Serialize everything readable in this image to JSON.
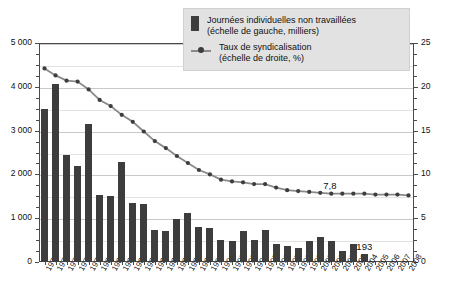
{
  "chart_data": {
    "type": "bar",
    "title": "",
    "subtitle": "",
    "xlabel": "",
    "ylabel": "",
    "grid": true,
    "legend_position": "top-right",
    "categories": [
      "1975",
      "1976",
      "1977",
      "1978",
      "1979",
      "1980",
      "1981",
      "1982",
      "1983",
      "1984",
      "1985",
      "1986",
      "1987",
      "1988",
      "1989",
      "1990",
      "1991",
      "1992",
      "1993",
      "1994",
      "1995",
      "1996",
      "1997",
      "1998",
      "1999",
      "2000",
      "2001",
      "2002",
      "2003",
      "2004",
      "2005",
      "2006",
      "2007",
      "2008"
    ],
    "axes": {
      "left": {
        "label": "Journées individuelles non travaillées (milliers)",
        "min": 0,
        "max": 5000,
        "ticks": [
          0,
          1000,
          2000,
          3000,
          4000,
          5000
        ],
        "tick_labels": [
          "0",
          "1 000",
          "2 000",
          "3 000",
          "4 000",
          "5 000"
        ],
        "minor_step": 250
      },
      "right": {
        "label": "Taux de syndicalisation (%)",
        "min": 0,
        "max": 25,
        "ticks": [
          0,
          5,
          10,
          15,
          20,
          25
        ],
        "tick_labels": [
          "0",
          "5",
          "10",
          "15",
          "20",
          "25"
        ],
        "minor_step": 1.25
      }
    },
    "series": [
      {
        "name": "Journées individuelles non travaillées (échelle de gauche, milliers)",
        "type": "bar",
        "axis": "left",
        "color": "#3d3d3d",
        "values": [
          3500,
          4070,
          2450,
          2200,
          3150,
          1520,
          1500,
          2280,
          1340,
          1320,
          720,
          700,
          980,
          1120,
          800,
          780,
          500,
          490,
          700,
          500,
          740,
          420,
          370,
          330,
          480,
          570,
          470,
          250,
          420,
          193,
          null,
          null,
          null,
          null
        ]
      },
      {
        "name": "Taux de syndicalisation (échelle de droite, %)",
        "type": "line",
        "axis": "right",
        "color": "#8a8a8a",
        "marker_color": "#3d3d3d",
        "values": [
          22.1,
          21.3,
          20.7,
          20.6,
          19.7,
          18.5,
          17.8,
          16.8,
          16.0,
          14.9,
          13.8,
          13.0,
          12.1,
          11.3,
          10.5,
          10.0,
          9.4,
          9.2,
          9.1,
          8.9,
          8.9,
          8.5,
          8.2,
          8.1,
          8.0,
          7.9,
          7.8,
          7.8,
          7.8,
          7.8,
          7.7,
          7.7,
          7.7,
          7.6
        ]
      }
    ],
    "annotations": [
      {
        "text": "7,8",
        "series": "Taux de syndicalisation",
        "x": "2001",
        "value": 7.8
      },
      {
        "text": "193",
        "series": "Journées individuelles non travaillées",
        "x": "2004",
        "value": 193
      }
    ]
  },
  "legend": {
    "items": [
      {
        "marker": "bar-swatch",
        "line1": "Journées individuelles non travaillées",
        "line2": "(échelle de gauche, milliers)"
      },
      {
        "marker": "line-swatch",
        "line1": "Taux de syndicalisation",
        "line2": "(échelle de droite, %)"
      }
    ]
  },
  "colors": {
    "bar": "#3d3d3d",
    "line": "#8a8a8a",
    "marker": "#3d3d3d",
    "grid": "#c9c9c9",
    "axis": "#4a4a4a",
    "legend_bg": "#e2e2e2"
  }
}
